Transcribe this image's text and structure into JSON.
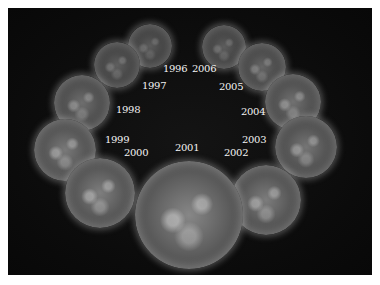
{
  "figure": {
    "years": [
      {
        "year": "1996",
        "cx": 150,
        "cy": 46,
        "r": 22,
        "brightness": 0.28
      },
      {
        "year": "1997",
        "cx": 117,
        "cy": 65,
        "r": 23,
        "brightness": 0.32
      },
      {
        "year": "1998",
        "cx": 82,
        "cy": 103,
        "r": 28,
        "brightness": 0.45
      },
      {
        "year": "1999",
        "cx": 65,
        "cy": 150,
        "r": 31,
        "brightness": 0.55
      },
      {
        "year": "2000",
        "cx": 100,
        "cy": 193,
        "r": 35,
        "brightness": 0.6
      },
      {
        "year": "2001",
        "cx": 189,
        "cy": 215,
        "r": 54,
        "brightness": 0.68
      },
      {
        "year": "2002",
        "cx": 266,
        "cy": 200,
        "r": 35,
        "brightness": 0.58
      },
      {
        "year": "2003",
        "cx": 306,
        "cy": 147,
        "r": 31,
        "brightness": 0.52
      },
      {
        "year": "2004",
        "cx": 293,
        "cy": 102,
        "r": 28,
        "brightness": 0.48
      },
      {
        "year": "2005",
        "cx": 262,
        "cy": 67,
        "r": 24,
        "brightness": 0.38
      },
      {
        "year": "2006",
        "cx": 224,
        "cy": 47,
        "r": 22,
        "brightness": 0.3
      }
    ],
    "labels": [
      {
        "text": "1996",
        "x": 163,
        "y": 69
      },
      {
        "text": "1997",
        "x": 142,
        "y": 86
      },
      {
        "text": "1998",
        "x": 116,
        "y": 110
      },
      {
        "text": "1999",
        "x": 105,
        "y": 140
      },
      {
        "text": "2000",
        "x": 124,
        "y": 153
      },
      {
        "text": "2001",
        "x": 175,
        "y": 148
      },
      {
        "text": "2002",
        "x": 224,
        "y": 153
      },
      {
        "text": "2003",
        "x": 242,
        "y": 140
      },
      {
        "text": "2004",
        "x": 241,
        "y": 112
      },
      {
        "text": "2005",
        "x": 219,
        "y": 87
      },
      {
        "text": "2006",
        "x": 192,
        "y": 69
      }
    ]
  }
}
